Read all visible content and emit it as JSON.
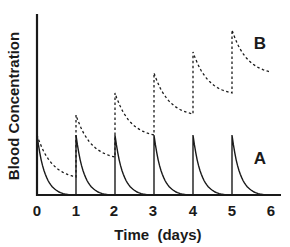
{
  "chart_data": {
    "type": "line",
    "title": "",
    "xlabel": "Time  (days)",
    "ylabel": "Blood Concentration",
    "xlim": [
      0,
      6
    ],
    "ylim": [
      0,
      180
    ],
    "x_ticks": [
      "0",
      "1",
      "2",
      "3",
      "4",
      "5",
      "6"
    ],
    "y_ticks": [],
    "grid": false,
    "legend": "inline labels",
    "dose_times": [
      0,
      1,
      2,
      3,
      4,
      5
    ],
    "series": [
      {
        "name": "A",
        "style": "solid",
        "description": "Single daily dose; concentration decays to ~0 before next dose",
        "peaks": [
          60,
          60,
          60,
          60,
          60,
          60
        ],
        "troughs_before_next_dose": [
          0,
          0,
          0,
          0,
          0,
          0
        ],
        "end_value_day6": 0
      },
      {
        "name": "B",
        "style": "dashed",
        "description": "Accumulation: drug not fully eliminated between doses",
        "peaks": [
          60,
          80,
          102,
          122,
          143,
          165
        ],
        "troughs_before_next_dose": [
          18,
          38,
          60,
          81,
          102
        ],
        "end_value_day6": 123
      }
    ],
    "annotations": [
      {
        "text": "B",
        "x": 5.85,
        "y": 152
      },
      {
        "text": "A",
        "x": 5.85,
        "y": 37
      }
    ]
  },
  "labels": {
    "ylabel": "Blood Concentration",
    "xlabel": "Time  (days)",
    "series_a": "A",
    "series_b": "B",
    "ticks": [
      "0",
      "1",
      "2",
      "3",
      "4",
      "5",
      "6"
    ]
  },
  "colors": {
    "line": "#1a1a1a",
    "background": "#ffffff"
  }
}
